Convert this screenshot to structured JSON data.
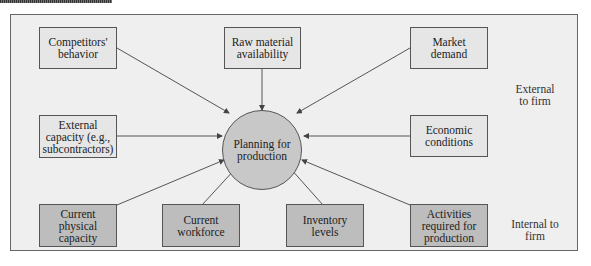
{
  "diagram": {
    "center": {
      "label": "Planning for\nproduction"
    },
    "external_factors": [
      {
        "id": "competitors",
        "label": "Competitors'\nbehavior"
      },
      {
        "id": "raw-material",
        "label": "Raw material\navailability"
      },
      {
        "id": "market-demand",
        "label": "Market\ndemand"
      },
      {
        "id": "external-capacity",
        "label": "External\ncapacity (e.g.,\nsubcontractors)"
      },
      {
        "id": "economic-conditions",
        "label": "Economic\nconditions"
      }
    ],
    "internal_factors": [
      {
        "id": "physical-capacity",
        "label": "Current\nphysical\ncapacity"
      },
      {
        "id": "workforce",
        "label": "Current\nworkforce"
      },
      {
        "id": "inventory",
        "label": "Inventory\nlevels"
      },
      {
        "id": "activities",
        "label": "Activities\nrequired for\nproduction"
      }
    ],
    "zone_labels": {
      "external": "External\nto firm",
      "internal": "Internal to\nfirm"
    },
    "colors": {
      "frame_bg": "#efefef",
      "external_box": "#e6e6e6",
      "internal_box": "#bdbdbd",
      "center_circle": "#c8c8c8",
      "stroke": "#555555"
    }
  }
}
